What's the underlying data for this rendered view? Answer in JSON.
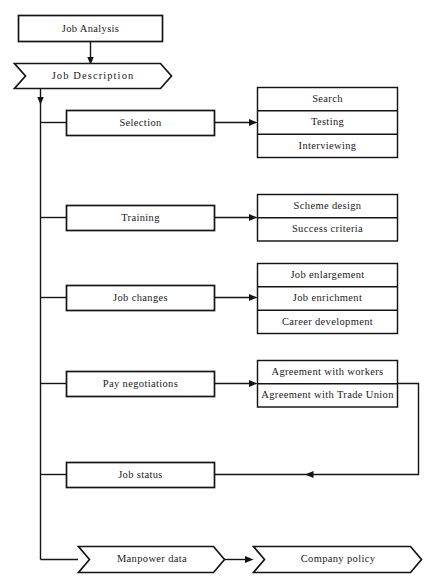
{
  "diagram": {
    "colors": {
      "line": "#141414",
      "fill": "#ffffff",
      "text": "#1a1a1a"
    },
    "top": {
      "job_analysis": "Job Analysis",
      "job_description": "Job Description"
    },
    "branches": [
      {
        "name": "selection",
        "label": "Selection",
        "outputs": [
          "Search",
          "Testing",
          "Interviewing"
        ]
      },
      {
        "name": "training",
        "label": "Training",
        "outputs": [
          "Scheme design",
          "Success criteria"
        ]
      },
      {
        "name": "job-changes",
        "label": "Job changes",
        "outputs": [
          "Job enlargement",
          "Job enrichment",
          "Career development"
        ]
      },
      {
        "name": "pay-negotiations",
        "label": "Pay negotiations",
        "outputs": [
          "Agreement with workers",
          "Agreement with Trade Union"
        ]
      },
      {
        "name": "job-status",
        "label": "Job status",
        "outputs": []
      }
    ],
    "bottom": {
      "manpower_data": "Manpower data",
      "company_policy": "Company policy"
    }
  }
}
